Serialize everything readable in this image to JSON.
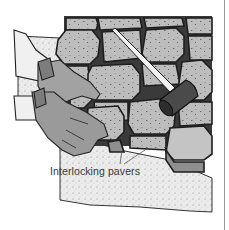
{
  "figure": {
    "label": "Interlocking pavers",
    "colors": {
      "paver_fill": "#b9b9b9",
      "paver_outline": "#2a2a2a",
      "mallet_head": "#4a4a4a",
      "mallet_handle": "#e8e8e8",
      "glove": "#9e9e9e",
      "sand": "#e6e6e6",
      "edge_line": "#9a9a9a"
    },
    "icons": [
      "paver-grid-icon",
      "mallet-icon",
      "gloved-hand-icon",
      "sand-bed-icon"
    ]
  }
}
